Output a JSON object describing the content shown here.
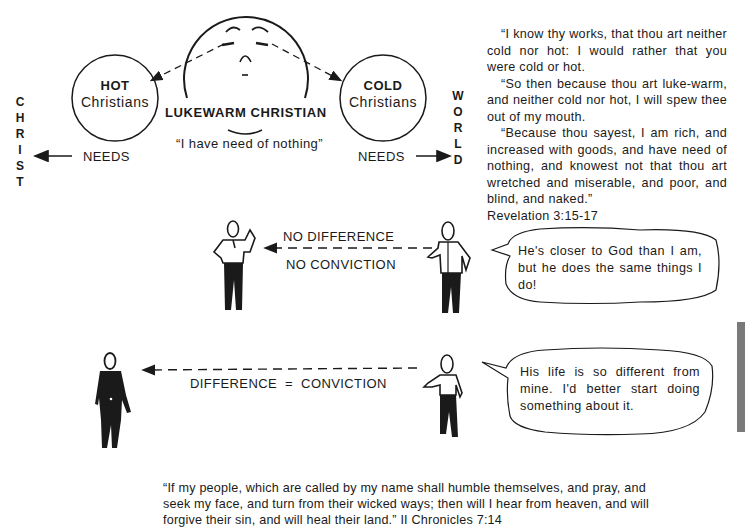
{
  "diagram": {
    "left_vertical": {
      "letters": [
        "C",
        "H",
        "R",
        "I",
        "S",
        "T"
      ],
      "word": "CHRIST"
    },
    "right_vertical": {
      "letters": [
        "W",
        "O",
        "R",
        "L",
        "D"
      ],
      "word": "WORLD"
    },
    "hot_circle": {
      "bold": "HOT",
      "normal": "Christians"
    },
    "cold_circle": {
      "bold": "COLD",
      "normal": "Christians"
    },
    "center": {
      "title": "LUKEWARM CHRISTIAN",
      "quote": "“I have need of nothing”"
    },
    "needs_left": "NEEDS",
    "needs_right": "NEEDS"
  },
  "scripture_top": {
    "paragraphs": [
      "“I know thy works, that thou art neither cold nor hot: I would rather that you were cold or hot.",
      "“So then because thou art luke-warm, and neither cold nor hot, I will spew thee out of my mouth.",
      "“Because thou sayest, I am rich, and increased with goods, and have need of nothing, and knowest not that thou art wretched and miserable, and poor, and blind, and naked.”"
    ],
    "reference": "Revelation 3:15-17"
  },
  "scene_one": {
    "label_top": "NO DIFFERENCE",
    "label_bottom": "NO CONVICTION",
    "bubble": "He's closer to God than I am, but he does the same things I do!"
  },
  "scene_two": {
    "label": "DIFFERENCE  =  CONVICTION",
    "bubble": "His life is so different from mine. I'd better start doing something about it."
  },
  "footer": {
    "line1": "“If my people, which are called by my name shall humble themselves, and pray, and",
    "line2": "seek my face, and turn from their wicked ways; then will I hear from heaven, and will",
    "line3": "forgive their sin, and will heal their land.”  II Chronicles 7:14"
  },
  "colors": {
    "ink": "#1a1a1a",
    "tab": "#7a7a7a",
    "paper": "#ffffff"
  }
}
